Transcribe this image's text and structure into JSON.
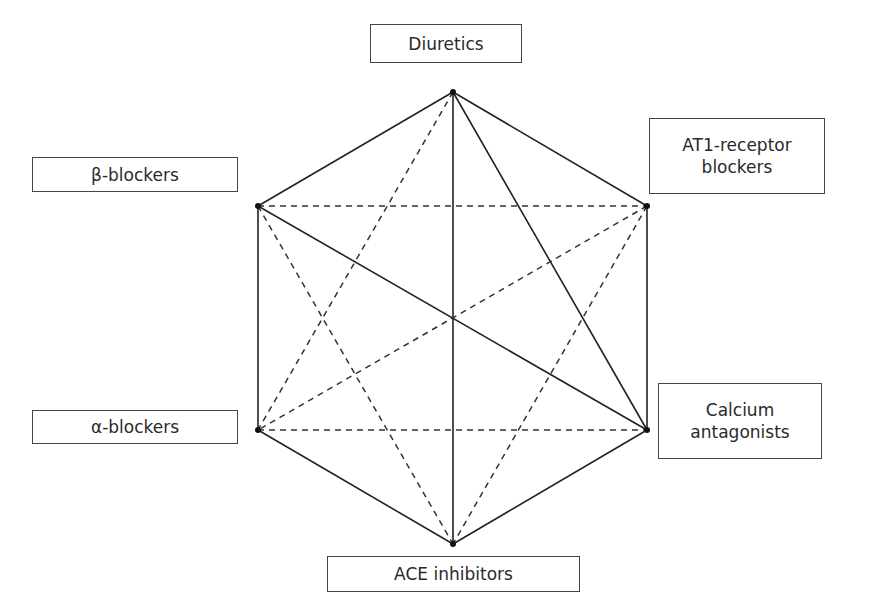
{
  "diagram": {
    "nodes": [
      {
        "id": "diuretics",
        "label": "Diuretics",
        "x": 453,
        "y": 92
      },
      {
        "id": "beta",
        "label": "β-blockers",
        "x": 258,
        "y": 206
      },
      {
        "id": "at1",
        "label": "AT1-receptor blockers",
        "label_lines": [
          "AT1-receptor",
          "blockers"
        ],
        "x": 647,
        "y": 206
      },
      {
        "id": "alpha",
        "label": "α-blockers",
        "x": 258,
        "y": 430
      },
      {
        "id": "calcium",
        "label": "Calcium antagonists",
        "label_lines": [
          "Calcium",
          "antagonists"
        ],
        "x": 647,
        "y": 430
      },
      {
        "id": "ace",
        "label": "ACE inhibitors",
        "x": 453,
        "y": 544
      }
    ],
    "edges_solid": [
      [
        "diuretics",
        "beta"
      ],
      [
        "diuretics",
        "at1"
      ],
      [
        "beta",
        "alpha"
      ],
      [
        "at1",
        "calcium"
      ],
      [
        "alpha",
        "ace"
      ],
      [
        "calcium",
        "ace"
      ],
      [
        "diuretics",
        "ace"
      ],
      [
        "diuretics",
        "calcium"
      ],
      [
        "beta",
        "calcium"
      ]
    ],
    "edges_dashed": [
      [
        "beta",
        "at1"
      ],
      [
        "alpha",
        "calcium"
      ],
      [
        "diuretics",
        "alpha"
      ],
      [
        "at1",
        "alpha"
      ],
      [
        "beta",
        "ace"
      ],
      [
        "at1",
        "ace"
      ]
    ],
    "colors": {
      "line": "#222222",
      "box_border": "#444444",
      "text": "#2a2a2a"
    }
  },
  "labels": {
    "diuretics": "Diuretics",
    "beta": "β-blockers",
    "at1_line1": "AT1-receptor",
    "at1_line2": "blockers",
    "alpha": "α-blockers",
    "calcium_line1": "Calcium",
    "calcium_line2": "antagonists",
    "ace": "ACE inhibitors"
  }
}
